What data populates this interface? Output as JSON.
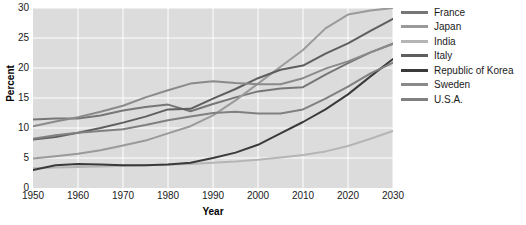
{
  "chart_data": {
    "type": "line",
    "title": "",
    "xlabel": "Year",
    "ylabel": "Percent",
    "xlim": [
      1950,
      2030
    ],
    "ylim": [
      0,
      30
    ],
    "xticks": [
      1950,
      1960,
      1970,
      1980,
      1990,
      2000,
      2010,
      2020,
      2030
    ],
    "yticks": [
      0,
      5,
      10,
      15,
      20,
      25,
      30
    ],
    "grid": true,
    "legend_position": "right",
    "plot_background": "#dcdcdc",
    "gridline_color": "#ffffff",
    "x": [
      1950,
      1955,
      1960,
      1965,
      1970,
      1975,
      1980,
      1985,
      1990,
      1995,
      2000,
      2005,
      2010,
      2015,
      2020,
      2025,
      2030
    ],
    "series": [
      {
        "name": "France",
        "color": "#767676",
        "values": [
          11.4,
          11.6,
          11.6,
          12.1,
          12.9,
          13.5,
          13.9,
          12.8,
          14.0,
          15.1,
          16.1,
          16.6,
          16.8,
          18.9,
          20.8,
          22.6,
          24.0
        ]
      },
      {
        "name": "Japan",
        "color": "#9a9a9a",
        "values": [
          4.9,
          5.3,
          5.7,
          6.3,
          7.1,
          7.9,
          9.1,
          10.3,
          12.1,
          14.6,
          17.4,
          20.2,
          23.0,
          26.6,
          28.9,
          29.6,
          30.0
        ]
      },
      {
        "name": "India",
        "color": "#b5b5b5",
        "values": [
          3.3,
          3.4,
          3.5,
          3.6,
          3.7,
          3.8,
          3.9,
          4.0,
          4.2,
          4.4,
          4.7,
          5.1,
          5.5,
          6.1,
          7.0,
          8.2,
          9.5
        ]
      },
      {
        "name": "Italy",
        "color": "#5e5e5e",
        "values": [
          8.1,
          8.5,
          9.2,
          10.0,
          10.9,
          11.9,
          13.1,
          13.2,
          14.9,
          16.5,
          18.3,
          19.7,
          20.4,
          22.4,
          24.1,
          26.2,
          28.2
        ]
      },
      {
        "name": "Republic of Korea",
        "color": "#3a3a3a",
        "values": [
          3.0,
          3.8,
          4.0,
          3.9,
          3.8,
          3.8,
          3.9,
          4.2,
          5.0,
          5.9,
          7.2,
          9.1,
          11.0,
          13.1,
          15.6,
          18.6,
          21.5
        ]
      },
      {
        "name": "Sweden",
        "color": "#8a8a8a",
        "values": [
          10.3,
          11.1,
          11.8,
          12.7,
          13.7,
          15.1,
          16.3,
          17.4,
          17.8,
          17.5,
          17.3,
          17.3,
          18.3,
          19.9,
          21.1,
          22.6,
          24.1
        ]
      },
      {
        "name": "U.S.A.",
        "color": "#808080",
        "values": [
          8.2,
          8.8,
          9.2,
          9.5,
          9.8,
          10.5,
          11.3,
          11.9,
          12.5,
          12.7,
          12.4,
          12.4,
          13.1,
          14.9,
          16.9,
          19.1,
          20.9
        ]
      }
    ]
  },
  "legend": {
    "items": [
      {
        "label": "France"
      },
      {
        "label": "Japan"
      },
      {
        "label": "India"
      },
      {
        "label": "Italy"
      },
      {
        "label": "Republic of Korea"
      },
      {
        "label": "Sweden"
      },
      {
        "label": "U.S.A."
      }
    ]
  }
}
